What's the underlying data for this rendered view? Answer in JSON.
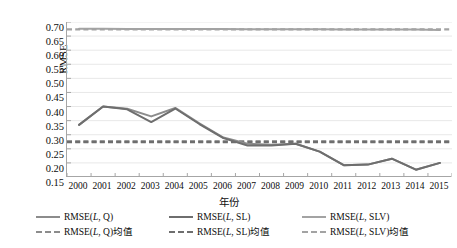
{
  "chart_data": {
    "type": "line",
    "title": "",
    "xlabel": "年份",
    "ylabel": "RMSE",
    "categories": [
      "2000",
      "2001",
      "2002",
      "2003",
      "2004",
      "2005",
      "2006",
      "2007",
      "2008",
      "2009",
      "2010",
      "2011",
      "2012",
      "2013",
      "2014",
      "2015"
    ],
    "x": [
      2000,
      2001,
      2002,
      2003,
      2004,
      2005,
      2006,
      2007,
      2008,
      2009,
      2010,
      2011,
      2012,
      2013,
      2014,
      2015
    ],
    "ylim": [
      0.15,
      0.7
    ],
    "yticks": [
      "0.70",
      "0.65",
      "0.60",
      "0.55",
      "0.50",
      "0.45",
      "0.40",
      "0.35",
      "0.30",
      "0.25",
      "0.20",
      "0.15"
    ],
    "ytick_values": [
      0.7,
      0.65,
      0.6,
      0.55,
      0.5,
      0.45,
      0.4,
      0.35,
      0.3,
      0.25,
      0.2,
      0.15
    ],
    "grid": true,
    "legend_position": "bottom",
    "series": [
      {
        "name": "RMSE(L, Q)",
        "style": "solid",
        "color": "#8c8c8c",
        "values": [
          0.335,
          0.4,
          0.392,
          0.365,
          0.395,
          0.34,
          0.29,
          0.268,
          0.264,
          0.268,
          0.24,
          0.192,
          0.194,
          0.215,
          0.176,
          0.2
        ]
      },
      {
        "name": "RMSE(L, SL)",
        "style": "solid",
        "color": "#6e6e6e",
        "values": [
          0.335,
          0.4,
          0.39,
          0.345,
          0.393,
          0.338,
          0.288,
          0.262,
          0.262,
          0.268,
          0.24,
          0.192,
          0.194,
          0.215,
          0.176,
          0.2
        ]
      },
      {
        "name": "RMSE(L, SLV)",
        "style": "solid",
        "color": "#a3a3a3",
        "values": [
          0.676,
          0.676,
          0.675,
          0.675,
          0.675,
          0.675,
          0.675,
          0.674,
          0.674,
          0.674,
          0.674,
          0.673,
          0.673,
          0.673,
          0.673,
          0.672
        ]
      },
      {
        "name": "RMSE(L, Q)均值",
        "style": "dashed",
        "color": "#8c8c8c",
        "constant": 0.276
      },
      {
        "name": "RMSE(L, SL)均值",
        "style": "dashed",
        "color": "#6e6e6e",
        "constant": 0.274
      },
      {
        "name": "RMSE(L, SLV)均值",
        "style": "dashed",
        "color": "#a3a3a3",
        "constant": 0.674
      }
    ]
  },
  "axes": {
    "y_title": "RMSE",
    "x_title": "年份",
    "y_tick_labels": [
      "0.70",
      "0.65",
      "0.60",
      "0.55",
      "0.50",
      "0.45",
      "0.40",
      "0.35",
      "0.30",
      "0.25",
      "0.20",
      "0.15"
    ],
    "x_tick_labels": [
      "2000",
      "2001",
      "2002",
      "2003",
      "2004",
      "2005",
      "2006",
      "2007",
      "2008",
      "2009",
      "2010",
      "2011",
      "2012",
      "2013",
      "2014",
      "2015"
    ]
  },
  "legend": {
    "solid_row": [
      {
        "label_prefix": "RMSE(",
        "label_italic": "L",
        "label_suffix": ", Q)",
        "full": "RMSE(L, Q)",
        "color": "#8c8c8c"
      },
      {
        "label_prefix": "RMSE(",
        "label_italic": "L",
        "label_suffix": ", SL)",
        "full": "RMSE(L, SL)",
        "color": "#6e6e6e"
      },
      {
        "label_prefix": "RMSE(",
        "label_italic": "L",
        "label_suffix": ", SLV)",
        "full": "RMSE(L, SLV)",
        "color": "#a3a3a3"
      }
    ],
    "dashed_row": [
      {
        "full": "RMSE(L, Q)均值",
        "color": "#8c8c8c"
      },
      {
        "full": "RMSE(L, SL)均值",
        "color": "#6e6e6e"
      },
      {
        "full": "RMSE(L, SLV)均值",
        "color": "#a3a3a3"
      }
    ]
  },
  "colors": {
    "grid": "#e8e8e8",
    "axis": "#a6a6a6",
    "background": "#ffffff"
  }
}
